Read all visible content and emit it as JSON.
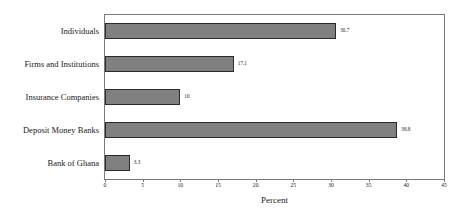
{
  "chart_data": {
    "type": "bar",
    "orientation": "horizontal",
    "title": "",
    "xlabel": "Percent",
    "ylabel": "",
    "xlim": [
      0,
      45
    ],
    "xticks": [
      0,
      5,
      10,
      15,
      20,
      25,
      30,
      35,
      40,
      45
    ],
    "grid": false,
    "legend": false,
    "categories": [
      "Individuals",
      "Firms and Institutions",
      "Insurance Companies",
      "Deposit Money Banks",
      "Bank of Ghana"
    ],
    "values": [
      30.7,
      17.1,
      10,
      38.8,
      3.3
    ],
    "value_labels": [
      "30.7",
      "17.1",
      "10",
      "38.8",
      "3.3"
    ],
    "tick_labels": [
      "0",
      "5",
      "10",
      "15",
      "20",
      "25",
      "30",
      "35",
      "40",
      "45"
    ],
    "colors": {
      "bar_fill": "#808080",
      "bar_border": "#2b2b2b",
      "frame": "#7a7a7a",
      "text": "#1a1a1a",
      "background": "#ffffff"
    }
  }
}
